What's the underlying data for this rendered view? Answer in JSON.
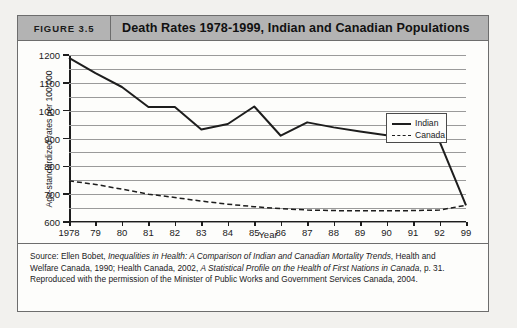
{
  "figure": {
    "number_label": "FIGURE 3.5",
    "title": "Death Rates 1978-1999, Indian and Canadian Populations"
  },
  "source": {
    "line1_a": "Source: Ellen Bobet, ",
    "line1_i": "Inequalities in Health: A Comparison of Indian and Canadian Mortality Trends",
    "line1_b": ", Health and",
    "line2_a": "Welfare Canada, 1990; Health Canada, 2002, ",
    "line2_i": "A Statistical Profile on the Health of First Nations in Canada",
    "line2_b": ", p. 31.",
    "line3": "Reproduced with the permission of the Minister of Public Works and Government Services Canada, 2004."
  },
  "chart_data": {
    "type": "line",
    "title": "Death Rates 1978-1999, Indian and Canadian Populations",
    "xlabel": "Year",
    "ylabel": "Age-standardized rates per 100 000",
    "grid": true,
    "legend_position": "top-right",
    "ylim": [
      600,
      1200
    ],
    "y_major_ticks": [
      600,
      700,
      800,
      900,
      1000,
      1100,
      1200
    ],
    "y_minor_ticks": [
      650,
      750,
      850,
      950,
      1050,
      1150
    ],
    "y_tick_labels": [
      "600",
      "700",
      "800",
      "900",
      "1000",
      "1100",
      "1200"
    ],
    "x": [
      1978,
      1979,
      1980,
      1981,
      1982,
      1983,
      1984,
      1985,
      1986,
      1987,
      1988,
      1989,
      1990,
      1991,
      1992,
      1999
    ],
    "x_tick_labels": [
      "1978",
      "79",
      "80",
      "81",
      "82",
      "83",
      "84",
      "85",
      "86",
      "87",
      "88",
      "89",
      "90",
      "91",
      "92",
      "99"
    ],
    "series": [
      {
        "name": "Indian",
        "style": "solid",
        "color": "#1d1d1d",
        "values": [
          1190,
          1135,
          1085,
          1013,
          1013,
          932,
          952,
          1015,
          910,
          958,
          940,
          925,
          912,
          898,
          890,
          660
        ]
      },
      {
        "name": "Canada",
        "style": "dashed",
        "color": "#1d1d1d",
        "values": [
          748,
          735,
          718,
          700,
          688,
          675,
          664,
          655,
          648,
          643,
          641,
          640,
          640,
          641,
          643,
          660
        ]
      }
    ]
  }
}
